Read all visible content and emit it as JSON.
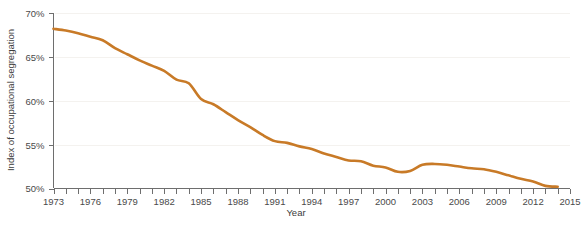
{
  "chart_data": {
    "type": "line",
    "title": "",
    "subtitle": "",
    "xlabel": "Year",
    "ylabel": "Index of occupational segregation",
    "xlim": [
      1973,
      2015
    ],
    "ylim": [
      50,
      70
    ],
    "grid": true,
    "legend": null,
    "y_tick_labels": [
      "70%",
      "65%",
      "60%",
      "55%",
      "50%"
    ],
    "y_ticks": [
      70,
      65,
      60,
      55,
      50
    ],
    "x_ticks": [
      1973,
      1974,
      1975,
      1976,
      1977,
      1978,
      1979,
      1980,
      1981,
      1982,
      1983,
      1984,
      1985,
      1986,
      1987,
      1988,
      1989,
      1990,
      1991,
      1992,
      1993,
      1994,
      1995,
      1996,
      1997,
      1998,
      1999,
      2000,
      2001,
      2002,
      2003,
      2004,
      2005,
      2006,
      2007,
      2008,
      2009,
      2010,
      2011,
      2012,
      2013,
      2014,
      2015
    ],
    "x_tick_labels": [
      "1973",
      "1976",
      "1979",
      "1982",
      "1985",
      "1988",
      "1991",
      "1994",
      "1997",
      "2000",
      "2003",
      "2006",
      "2009",
      "2012",
      "2015"
    ],
    "labeled_x_ticks": [
      1973,
      1976,
      1979,
      1982,
      1985,
      1988,
      1991,
      1994,
      1997,
      2000,
      2003,
      2006,
      2009,
      2012,
      2015
    ],
    "series": [
      {
        "name": "Index of occupational segregation",
        "color": "#C87A27",
        "x": [
          1973,
          1974,
          1975,
          1976,
          1977,
          1978,
          1979,
          1980,
          1981,
          1982,
          1983,
          1984,
          1985,
          1986,
          1987,
          1988,
          1989,
          1990,
          1991,
          1992,
          1993,
          1994,
          1995,
          1996,
          1997,
          1998,
          1999,
          2000,
          2001,
          2002,
          2003,
          2004,
          2005,
          2006,
          2007,
          2008,
          2009,
          2010,
          2011,
          2012,
          2013,
          2014
        ],
        "values": [
          68.2,
          68.0,
          67.7,
          67.3,
          66.9,
          66.0,
          65.3,
          64.6,
          64.0,
          63.4,
          62.4,
          62.0,
          60.2,
          59.6,
          58.7,
          57.8,
          57.0,
          56.1,
          55.4,
          55.2,
          54.8,
          54.5,
          54.0,
          53.6,
          53.2,
          53.1,
          52.6,
          52.4,
          51.9,
          52.0,
          52.7,
          52.8,
          52.7,
          52.5,
          52.3,
          52.2,
          51.9,
          51.5,
          51.1,
          50.8,
          50.3,
          50.2
        ]
      }
    ]
  }
}
